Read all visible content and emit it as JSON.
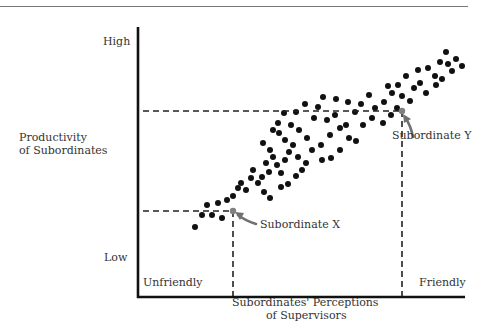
{
  "chart_data": {
    "type": "scatter",
    "title": "",
    "xlabel": "Subordinates' Perceptions of Supervisors",
    "ylabel": "Productivity of Subordinates",
    "x_ticks": {
      "low": "Unfriendly",
      "high": "Friendly"
    },
    "y_ticks": {
      "low": "Low",
      "high": "High"
    },
    "xlim": [
      0,
      100
    ],
    "ylim": [
      0,
      100
    ],
    "grid": false,
    "legend": null,
    "point_color": "#111111",
    "highlight_color": "#808080",
    "points_px": [
      [
        195,
        227
      ],
      [
        202,
        215
      ],
      [
        207,
        205
      ],
      [
        212,
        215
      ],
      [
        222,
        218
      ],
      [
        218,
        203
      ],
      [
        227,
        200
      ],
      [
        233,
        196
      ],
      [
        238,
        188
      ],
      [
        246,
        190
      ],
      [
        241,
        183
      ],
      [
        251,
        178
      ],
      [
        253,
        170
      ],
      [
        258,
        183
      ],
      [
        262,
        177
      ],
      [
        269,
        172
      ],
      [
        266,
        163
      ],
      [
        273,
        157
      ],
      [
        277,
        165
      ],
      [
        281,
        173
      ],
      [
        285,
        160
      ],
      [
        289,
        152
      ],
      [
        270,
        150
      ],
      [
        263,
        143
      ],
      [
        264,
        192
      ],
      [
        270,
        198
      ],
      [
        281,
        187
      ],
      [
        288,
        184
      ],
      [
        296,
        176
      ],
      [
        302,
        170
      ],
      [
        306,
        163
      ],
      [
        298,
        157
      ],
      [
        293,
        145
      ],
      [
        285,
        140
      ],
      [
        279,
        133
      ],
      [
        273,
        130
      ],
      [
        278,
        123
      ],
      [
        291,
        125
      ],
      [
        299,
        130
      ],
      [
        307,
        138
      ],
      [
        312,
        150
      ],
      [
        321,
        145
      ],
      [
        314,
        118
      ],
      [
        327,
        120
      ],
      [
        335,
        115
      ],
      [
        340,
        128
      ],
      [
        330,
        135
      ],
      [
        322,
        160
      ],
      [
        331,
        158
      ],
      [
        340,
        150
      ],
      [
        349,
        138
      ],
      [
        356,
        141
      ],
      [
        346,
        125
      ],
      [
        355,
        112
      ],
      [
        348,
        102
      ],
      [
        361,
        104
      ],
      [
        369,
        95
      ],
      [
        375,
        108
      ],
      [
        384,
        102
      ],
      [
        372,
        118
      ],
      [
        363,
        125
      ],
      [
        383,
        123
      ],
      [
        391,
        115
      ],
      [
        397,
        108
      ],
      [
        392,
        93
      ],
      [
        388,
        86
      ],
      [
        398,
        85
      ],
      [
        406,
        76
      ],
      [
        402,
        96
      ],
      [
        410,
        101
      ],
      [
        414,
        88
      ],
      [
        420,
        83
      ],
      [
        418,
        70
      ],
      [
        428,
        68
      ],
      [
        435,
        76
      ],
      [
        426,
        93
      ],
      [
        436,
        85
      ],
      [
        442,
        79
      ],
      [
        448,
        64
      ],
      [
        452,
        71
      ],
      [
        456,
        59
      ],
      [
        446,
        52
      ],
      [
        440,
        62
      ],
      [
        462,
        66
      ],
      [
        284,
        113
      ],
      [
        296,
        112
      ],
      [
        305,
        104
      ],
      [
        318,
        107
      ],
      [
        323,
        97
      ],
      [
        336,
        99
      ]
    ],
    "highlighted_points": [
      {
        "label": "Subordinate X",
        "px": [
          233,
          211
        ],
        "x": 30,
        "y": 32
      },
      {
        "label": "Subordinate Y",
        "px": [
          402,
          111
        ],
        "x": 82,
        "y": 69
      }
    ],
    "trend": "positive correlation"
  },
  "axis": {
    "y_high": "High",
    "y_low": "Low",
    "x_low": "Unfriendly",
    "x_high": "Friendly"
  },
  "labels": {
    "ylabel_line1": "Productivity",
    "ylabel_line2": "of Subordinates",
    "xlabel_line1": "Subordinates' Perceptions",
    "xlabel_line2": "of Supervisors",
    "sub_x": "Subordinate X",
    "sub_y": "Subordinate Y"
  }
}
